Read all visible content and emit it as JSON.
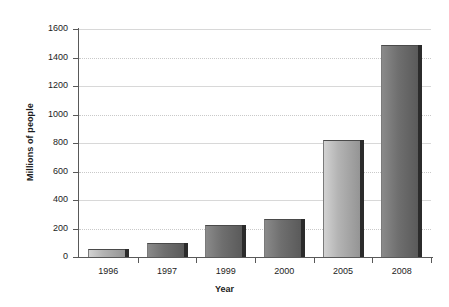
{
  "chart_data": {
    "type": "bar",
    "title": "",
    "xlabel": "Year",
    "ylabel": "Millions of people",
    "categories": [
      "1996",
      "1997",
      "1999",
      "2000",
      "2005",
      "2008"
    ],
    "values": [
      55,
      98,
      225,
      265,
      820,
      1490
    ],
    "ylim": [
      0,
      1600
    ],
    "ytick_labels": [
      "0",
      "200",
      "400",
      "600",
      "800",
      "1000",
      "1200",
      "1400",
      "1600"
    ],
    "ytick_values": [
      0,
      200,
      400,
      600,
      800,
      1000,
      1200,
      1400,
      1600
    ],
    "grid": true,
    "legend": false,
    "series": [
      {
        "name": "Millions of people",
        "values": [
          55,
          98,
          225,
          265,
          820,
          1490
        ]
      }
    ],
    "bar_styles": [
      "light",
      "dark",
      "dark",
      "dark",
      "light",
      "dark"
    ],
    "colors": {
      "bar_light_start": "#d2d2d2",
      "bar_light_end": "#8f8f8f",
      "bar_dark_start": "#8a8a8a",
      "bar_dark_end": "#565656",
      "bar_shadow": "#2b2b2b",
      "axis": "#595959",
      "gridline": "#c9c9c9",
      "text": "#1c1c1c",
      "background": "#ffffff"
    }
  }
}
